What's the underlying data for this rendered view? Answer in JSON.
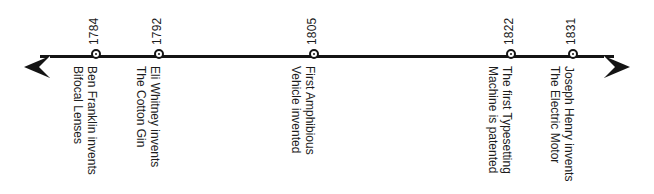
{
  "timeline": {
    "axis": {
      "left_arrow_icon": "arrow-left-icon",
      "right_arrow_icon": "arrow-right-icon",
      "line_color": "#141414",
      "background_color": "#ffffff"
    },
    "events": [
      {
        "year": "1784",
        "x": 98,
        "line1": "Ben Franklin invents",
        "line2": "Bifocal Lenses",
        "marker_icon": "circle-node-icon"
      },
      {
        "year": "1792",
        "x": 161,
        "line1": "Eli Whitney invents",
        "line2": "The Cotton Gin",
        "marker_icon": "circle-node-icon"
      },
      {
        "year": "1805",
        "x": 316,
        "line1": "First Amphibious",
        "line2": "Vehicle invented",
        "marker_icon": "circle-node-icon"
      },
      {
        "year": "1822",
        "x": 513,
        "line1": "The first Typesetting",
        "line2": "Machine is patented",
        "marker_icon": "circle-node-icon"
      },
      {
        "year": "1831",
        "x": 575,
        "line1": "Joseph Henry invents",
        "line2": "The Electric Motor",
        "marker_icon": "circle-node-icon"
      }
    ]
  }
}
